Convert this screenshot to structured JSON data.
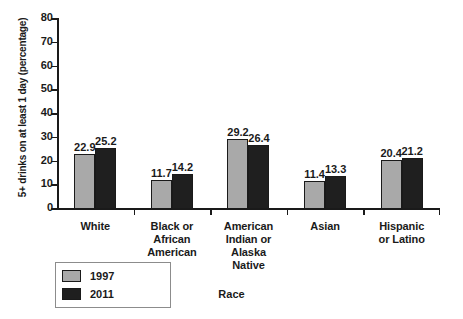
{
  "chart_data": {
    "type": "bar",
    "title": "",
    "xlabel": "Race",
    "ylabel": "5+ drinks on at least 1 day (percentage)",
    "ylim": [
      0,
      80
    ],
    "yticks": [
      0,
      10,
      20,
      30,
      40,
      50,
      60,
      70,
      80
    ],
    "grid": false,
    "legend_position": "bottom-left",
    "categories": [
      "White",
      "Black or African American",
      "American Indian or Alaska Native",
      "Asian",
      "Hispanic or Latino"
    ],
    "category_lines": [
      [
        "White"
      ],
      [
        "Black or",
        "African",
        "American"
      ],
      [
        "American",
        "Indian or",
        "Alaska",
        "Native"
      ],
      [
        "Asian"
      ],
      [
        "Hispanic",
        "or Latino"
      ]
    ],
    "series": [
      {
        "name": "1997",
        "color": "#a9a9a9",
        "values": [
          22.9,
          11.7,
          29.2,
          11.4,
          20.4
        ]
      },
      {
        "name": "2011",
        "color": "#1f1f1f",
        "values": [
          25.2,
          14.2,
          26.4,
          13.3,
          21.2
        ]
      }
    ]
  },
  "legend": {
    "items": [
      {
        "label": "1997",
        "color": "#a9a9a9"
      },
      {
        "label": "2011",
        "color": "#1f1f1f"
      }
    ]
  },
  "colors": {
    "background": "#ffffff",
    "axis": "#1a1a1a",
    "text": "#1a1a1a",
    "series_1997": "#a9a9a9",
    "series_2011": "#1f1f1f",
    "legend_border": "#8c8c8c"
  }
}
